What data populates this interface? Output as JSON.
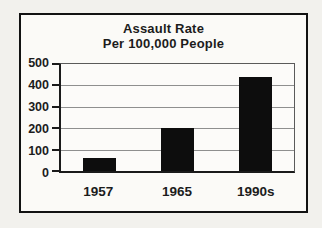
{
  "chart_data": {
    "type": "bar",
    "title_line1": "Assault Rate",
    "title_line2": "Per 100,000 People",
    "categories": [
      "1957",
      "1965",
      "1990s"
    ],
    "values": [
      60,
      200,
      440
    ],
    "ylim": [
      0,
      500
    ],
    "ytick_step": 100,
    "ytick_labels": [
      "0",
      "100",
      "200",
      "300",
      "400",
      "500"
    ],
    "xlabel": "",
    "ylabel": "",
    "grid": true,
    "legend": false
  },
  "colors": {
    "bar": "#0d0d0d",
    "grid": "#8f8f8f",
    "axis": "#1a1a1a",
    "frame_border": "#121212",
    "page_bg": "#f2f1ed",
    "chart_bg": "#fbfaf7"
  }
}
